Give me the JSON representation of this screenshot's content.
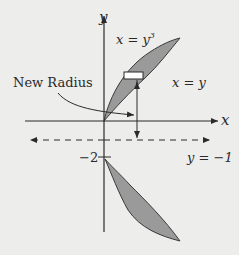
{
  "diagram": {
    "axes": {
      "x_label": "x",
      "y_label": "y"
    },
    "curves": {
      "upper_label": "x = y",
      "upper_label_exp": "3",
      "right_label": "x = y"
    },
    "annotations": {
      "new_radius": "New Radius",
      "tick_minus_two": "−2",
      "axis_of_rotation": "y = −1"
    },
    "colors": {
      "background": "#ededeb",
      "region_fill": "#9a9a9a",
      "line": "#2a2a2a",
      "rectangle_fill": "#ffffff"
    }
  }
}
